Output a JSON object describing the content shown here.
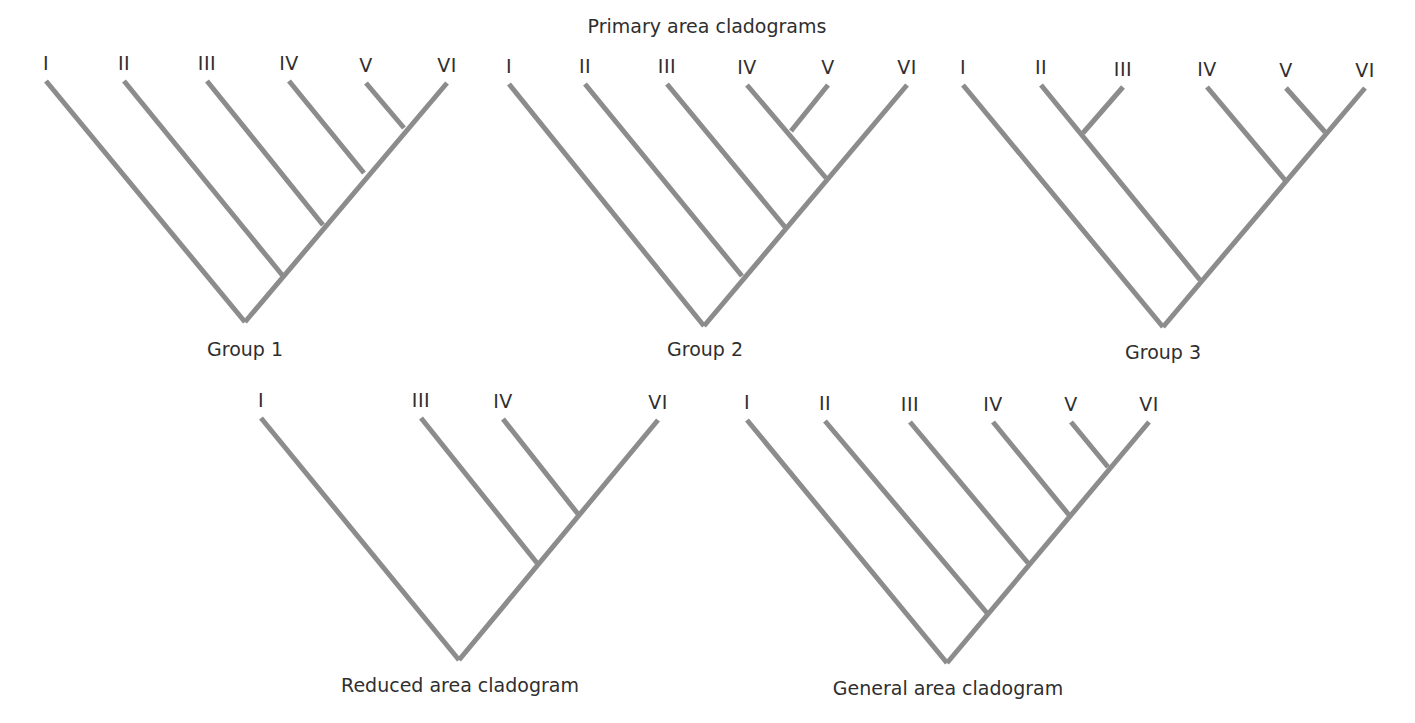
{
  "title": "Primary area cladograms",
  "colors": {
    "branch": "#8c8c8c",
    "text": "#2f2f2f",
    "background": "#ffffff"
  },
  "cladograms": [
    {
      "id": "group1",
      "label": "Group 1",
      "topology": "(I,(II,(III,(IV,(V,VI)))))",
      "label_pos": [
        245,
        340
      ],
      "tips": [
        {
          "name": "I",
          "x": 46,
          "y": 81
        },
        {
          "name": "II",
          "x": 124,
          "y": 81
        },
        {
          "name": "III",
          "x": 207,
          "y": 81
        },
        {
          "name": "IV",
          "x": 289,
          "y": 81
        },
        {
          "name": "V",
          "x": 366,
          "y": 83
        },
        {
          "name": "VI",
          "x": 447,
          "y": 83
        }
      ],
      "edges": [
        [
          46,
          81,
          245,
          322
        ],
        [
          447,
          83,
          245,
          322
        ],
        [
          124,
          81,
          283,
          276
        ],
        [
          207,
          81,
          323,
          225
        ],
        [
          289,
          81,
          364,
          173
        ],
        [
          366,
          83,
          404,
          128
        ]
      ]
    },
    {
      "id": "group2",
      "label": "Group 2",
      "topology": "(I,(II,(III,((IV,V),VI))))",
      "label_pos": [
        705,
        340
      ],
      "tips": [
        {
          "name": "I",
          "x": 509,
          "y": 84
        },
        {
          "name": "II",
          "x": 585,
          "y": 84
        },
        {
          "name": "III",
          "x": 667,
          "y": 84
        },
        {
          "name": "IV",
          "x": 747,
          "y": 85
        },
        {
          "name": "V",
          "x": 828,
          "y": 85
        },
        {
          "name": "VI",
          "x": 907,
          "y": 85
        }
      ],
      "edges": [
        [
          509,
          84,
          704,
          326
        ],
        [
          907,
          85,
          704,
          326
        ],
        [
          585,
          84,
          742,
          276
        ],
        [
          667,
          84,
          785,
          227
        ],
        [
          747,
          85,
          826,
          178
        ],
        [
          828,
          85,
          791,
          131
        ]
      ]
    },
    {
      "id": "group3",
      "label": "Group 3",
      "topology": "(I,((II,III),(IV,(V,VI))))",
      "label_pos": [
        1163,
        343
      ],
      "tips": [
        {
          "name": "I",
          "x": 963,
          "y": 85
        },
        {
          "name": "II",
          "x": 1041,
          "y": 85
        },
        {
          "name": "III",
          "x": 1123,
          "y": 87
        },
        {
          "name": "IV",
          "x": 1207,
          "y": 87
        },
        {
          "name": "V",
          "x": 1286,
          "y": 88
        },
        {
          "name": "VI",
          "x": 1365,
          "y": 88
        }
      ],
      "edges": [
        [
          963,
          85,
          1163,
          327
        ],
        [
          1365,
          88,
          1163,
          327
        ],
        [
          1041,
          85,
          1200,
          280
        ],
        [
          1123,
          87,
          1083,
          133
        ],
        [
          1207,
          87,
          1285,
          180
        ],
        [
          1286,
          88,
          1325,
          132
        ]
      ]
    },
    {
      "id": "reduced",
      "label": "Reduced area cladogram",
      "topology": "(I,(III,(IV,VI)))",
      "label_pos": [
        460,
        676
      ],
      "tips": [
        {
          "name": "I",
          "x": 261,
          "y": 418
        },
        {
          "name": "III",
          "x": 421,
          "y": 418
        },
        {
          "name": "IV",
          "x": 503,
          "y": 419
        },
        {
          "name": "VI",
          "x": 658,
          "y": 420
        }
      ],
      "edges": [
        [
          261,
          418,
          459,
          660
        ],
        [
          658,
          420,
          459,
          660
        ],
        [
          421,
          418,
          537,
          563
        ],
        [
          503,
          419,
          578,
          514
        ]
      ]
    },
    {
      "id": "general",
      "label": "General area cladogram",
      "topology": "(I,(II,(III,(IV,(V,VI)))))",
      "label_pos": [
        948,
        679
      ],
      "tips": [
        {
          "name": "I",
          "x": 747,
          "y": 420
        },
        {
          "name": "II",
          "x": 825,
          "y": 421
        },
        {
          "name": "III",
          "x": 910,
          "y": 422
        },
        {
          "name": "IV",
          "x": 993,
          "y": 422
        },
        {
          "name": "V",
          "x": 1071,
          "y": 422
        },
        {
          "name": "VI",
          "x": 1149,
          "y": 422
        }
      ],
      "edges": [
        [
          747,
          420,
          947,
          663
        ],
        [
          1149,
          422,
          947,
          663
        ],
        [
          825,
          421,
          987,
          613
        ],
        [
          910,
          422,
          1028,
          563
        ],
        [
          993,
          422,
          1069,
          515
        ],
        [
          1071,
          422,
          1108,
          467
        ]
      ]
    }
  ]
}
